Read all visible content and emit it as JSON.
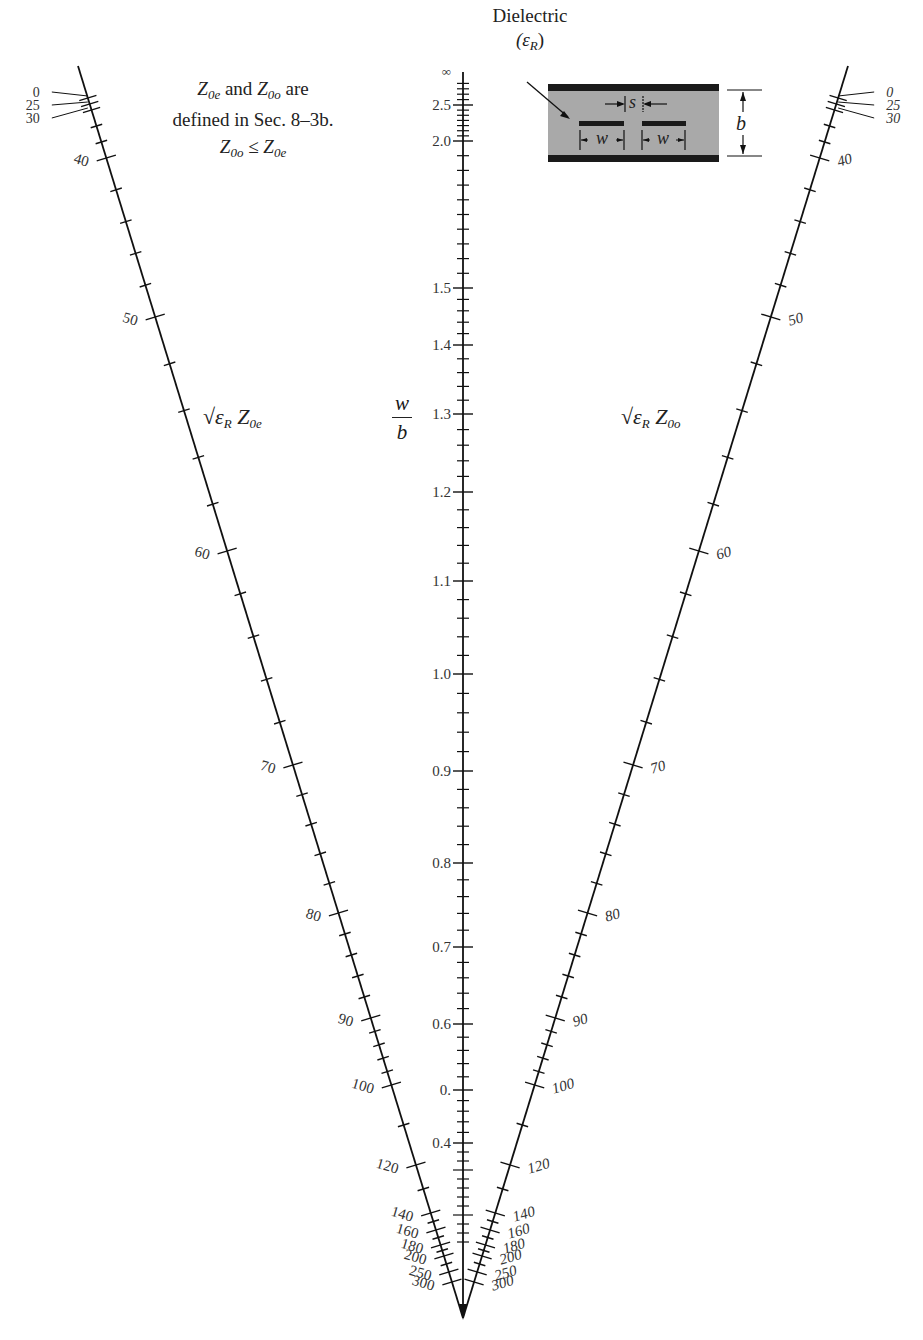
{
  "notes": {
    "definition_line1_a": "Z",
    "definition_line1_sub1": "0e",
    "definition_line1_mid": " and ",
    "definition_line1_b": "Z",
    "definition_line1_sub2": "0o",
    "definition_line1_end": " are",
    "definition_line2": "defined in Sec. 8–3b.",
    "inequality_a": "Z",
    "inequality_sub1": "0o",
    "inequality_op": " ≤ ",
    "inequality_b": "Z",
    "inequality_sub2": "0e"
  },
  "inset": {
    "dielectric_label": "Dielectric",
    "epsilon_label": "(ε",
    "epsilon_sub": "R",
    "epsilon_close": ")",
    "spacing_label": "s",
    "width_label_left": "w",
    "width_label_right": "w",
    "height_label": "b",
    "dielectric_color": "#a8a8a8",
    "conductor_color": "#1a1a1a"
  },
  "chart_data": {
    "type": "nomograph",
    "scales": [
      {
        "name": "left",
        "label": "√ε_R Z_0e",
        "label_parts": {
          "root": "√ε",
          "root_sub": "R",
          "z": " Z",
          "z_sub": "0e"
        },
        "major_ticks": [
          0,
          25,
          30,
          40,
          50,
          60,
          70,
          80,
          90,
          100,
          120,
          140,
          160,
          180,
          200,
          250,
          300
        ],
        "tick_positions_y": [
          98,
          104,
          110,
          158,
          317,
          551,
          765,
          913,
          1018,
          1085,
          1165,
          1213,
          1230,
          1245,
          1256,
          1272,
          1282
        ],
        "minor_per_interval": {
          "30-40": 2,
          "40-50": 4,
          "50-60": 4,
          "60-70": 4,
          "70-80": 4,
          "80-90": 4,
          "90-100": 1,
          "100-120": 1,
          "120-140": 1,
          "140-160": 1,
          "160-200": 2
        }
      },
      {
        "name": "center",
        "label": "w/b",
        "label_parts": {
          "num": "w",
          "den": "b"
        },
        "major_ticks": [
          "∞",
          "2.5",
          "2.0",
          "1.5",
          "1.4",
          "1.3",
          "1.2",
          "1.1",
          "1.0",
          "0.9",
          "0.8",
          "0.7",
          "0.6",
          "0.",
          "0.4"
        ],
        "tick_values": [
          null,
          2.5,
          2.0,
          1.5,
          1.4,
          1.3,
          1.2,
          1.1,
          1.0,
          0.9,
          0.8,
          0.7,
          0.6,
          0.5,
          0.4
        ],
        "tick_positions_y": [
          78,
          105,
          141,
          288,
          345,
          414,
          492,
          581,
          674,
          771,
          863,
          947,
          1024,
          1090,
          1143
        ]
      },
      {
        "name": "right",
        "label": "√ε_R Z_0o",
        "label_parts": {
          "root": "√ε",
          "root_sub": "R",
          "z": " Z",
          "z_sub": "0o"
        },
        "major_ticks": [
          0,
          25,
          30,
          40,
          50,
          60,
          70,
          80,
          90,
          100,
          120,
          140,
          160,
          180,
          200,
          250,
          300
        ],
        "tick_positions_y": [
          98,
          104,
          110,
          158,
          317,
          551,
          765,
          913,
          1018,
          1085,
          1165,
          1213,
          1230,
          1245,
          1256,
          1272,
          1282
        ]
      }
    ],
    "apex": {
      "x": 463,
      "y": 1318
    },
    "note": "Z_0e and Z_0o are defined in Sec. 8-3b. Z_0o ≤ Z_0e"
  }
}
